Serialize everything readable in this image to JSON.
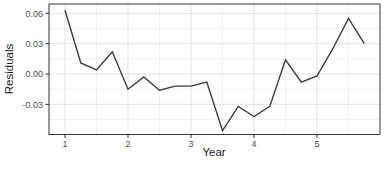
{
  "figure": {
    "width": 385,
    "height": 171,
    "background": "#ffffff",
    "panel": {
      "left": 49,
      "top": 4,
      "right": 380,
      "bottom": 134.5
    },
    "colors": {
      "line": "#3b3b3b",
      "panel_border": "#333333",
      "grid_major": "#e3e3e3",
      "grid_minor": "#f0f0f0",
      "tick_mark": "#333333",
      "tick_label": "#4d4d4d",
      "axis_title": "#1a1a1a"
    }
  },
  "chart_data": {
    "type": "line",
    "title": "",
    "xlabel": "Year",
    "ylabel": "Residuals",
    "series": [
      {
        "name": "residuals",
        "x": [
          1.0,
          1.25,
          1.5,
          1.75,
          2.0,
          2.25,
          2.5,
          2.75,
          3.0,
          3.25,
          3.5,
          3.75,
          4.0,
          4.25,
          4.5,
          4.75,
          5.0,
          5.25,
          5.5,
          5.75
        ],
        "y": [
          0.063,
          0.011,
          0.004,
          0.022,
          -0.015,
          -0.003,
          -0.016,
          -0.012,
          -0.012,
          -0.008,
          -0.056,
          -0.032,
          -0.042,
          -0.032,
          0.014,
          -0.008,
          -0.002,
          0.025,
          0.055,
          0.03
        ]
      }
    ],
    "xlim": [
      0.746,
      6.0
    ],
    "ylim": [
      -0.0598,
      0.0692
    ],
    "x_ticks": [
      1,
      2,
      3,
      4,
      5
    ],
    "x_tick_labels": [
      "1",
      "2",
      "3",
      "4",
      "5"
    ],
    "y_ticks": [
      0.06,
      0.03,
      0.0,
      -0.03
    ],
    "y_tick_labels": [
      "0.06",
      "0.03",
      "0.00",
      "-0.03"
    ],
    "x_minor_gridlines": [
      1.5,
      2.5,
      3.5,
      4.5,
      5.5
    ],
    "y_minor_gridlines": [
      0.045,
      0.015,
      -0.015,
      -0.045
    ],
    "grid": true,
    "legend": false
  }
}
